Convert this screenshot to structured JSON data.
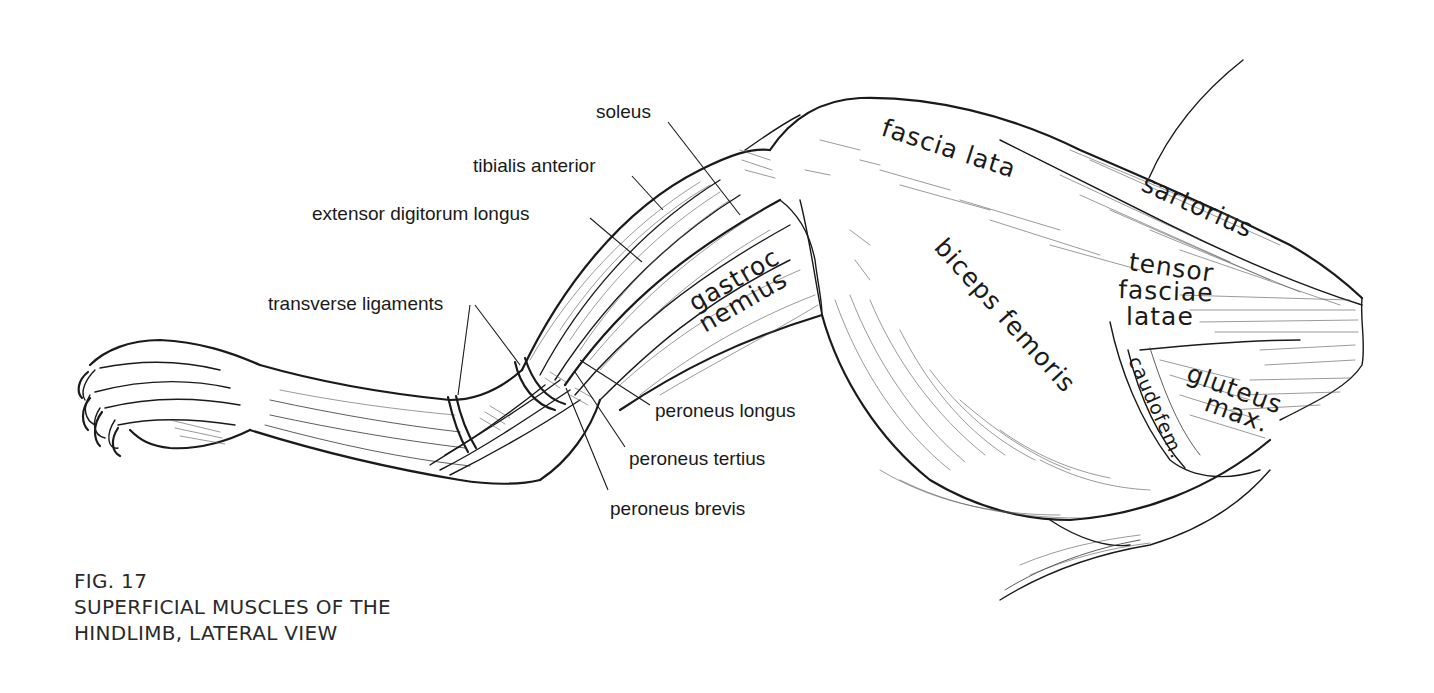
{
  "figure": {
    "number": "FIG. 17",
    "title_line1": "SUPERFICIAL MUSCLES OF THE",
    "title_line2": "HINDLIMB, LATERAL VIEW",
    "ink_color": "#1a1a1a",
    "background": "#ffffff"
  },
  "labels": {
    "external": {
      "soleus": "soleus",
      "tibialis_anterior": "tibialis anterior",
      "extensor_digitorum_longus": "extensor digitorum longus",
      "transverse_ligaments": "transverse ligaments",
      "peroneus_longus": "peroneus longus",
      "peroneus_tertius": "peroneus tertius",
      "peroneus_brevis": "peroneus brevis"
    },
    "internal": {
      "fascia_lata": "fascia lata",
      "sartorius": "sartorius",
      "tensor_line1": "tensor",
      "tensor_line2": "fasciae",
      "tensor_line3": "latae",
      "gastroc_line1": "gastroc",
      "gastroc_line2": "nemius",
      "biceps_femoris": "biceps femoris",
      "caudofem": "caudofem.",
      "gluteus_line1": "gluteus",
      "gluteus_line2": "max."
    }
  }
}
